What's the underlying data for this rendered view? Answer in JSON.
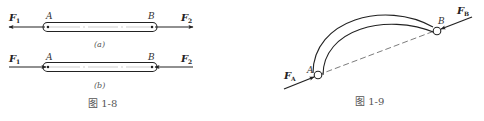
{
  "figure_1_8": {
    "caption": "图 1-8",
    "sub_a": {
      "caption": "(a)",
      "point_a": "A",
      "point_b": "B",
      "force_left": "F",
      "force_left_sub": "1",
      "force_right": "F",
      "force_right_sub": "2",
      "direction": "tension (forces point outward)"
    },
    "sub_b": {
      "caption": "(b)",
      "point_a": "A",
      "point_b": "B",
      "force_left": "F",
      "force_left_sub": "1",
      "force_right": "F",
      "force_right_sub": "2",
      "direction": "compression (forces point inward)"
    }
  },
  "figure_1_9": {
    "caption": "图 1-9",
    "point_a": "A",
    "point_b": "B",
    "force_a": "F",
    "force_a_sub": "A",
    "force_b": "F",
    "force_b_sub": "B"
  },
  "colors": {
    "stroke": "#222222",
    "label": "#333333",
    "caption": "#555555"
  }
}
